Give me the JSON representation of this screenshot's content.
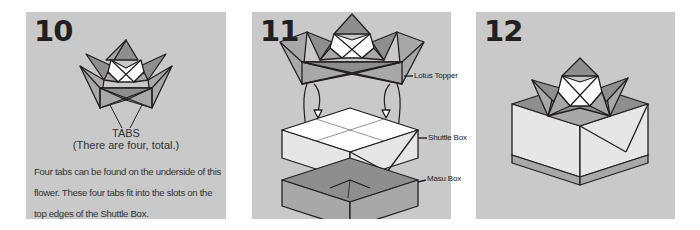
{
  "colors": {
    "panel_bg": "#c9c9c9",
    "dark_fill": "#8e8e8e",
    "mid_fill": "#a8a8a8",
    "light_fill": "#e6e6e6",
    "white_fill": "#ffffff",
    "stroke": "#231f20"
  },
  "steps": [
    {
      "number": "10",
      "tabs_label": "TABS",
      "tabs_note": "(There are four, total.)",
      "description": "Four tabs can be found on the underside of this flower. These four tabs fit into the slots on the top edges of the Shuttle Box."
    },
    {
      "number": "11",
      "callouts": {
        "lotus_topper": "Lotus Topper",
        "shuttle_box": "Shuttle Box",
        "masu_box": "Masu Box"
      }
    },
    {
      "number": "12"
    }
  ]
}
